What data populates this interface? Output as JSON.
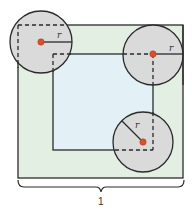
{
  "diagram": {
    "outer_square": {
      "x": 18,
      "y": 25,
      "w": 165,
      "h": 153,
      "fill": "#e2efe2",
      "stroke": "#2b2b2b"
    },
    "inner_square": {
      "x": 53,
      "y": 54,
      "w": 100,
      "h": 96,
      "fill": "#e3f1f7",
      "stroke": "#2b2b2b"
    },
    "circles": [
      {
        "id": "top-left",
        "cx": 41,
        "cy": 42,
        "r": 31,
        "radius_label": "r",
        "label_x": 58,
        "label_y": 37
      },
      {
        "id": "top-right",
        "cx": 153,
        "cy": 55,
        "r": 30,
        "radius_label": "r",
        "label_x": 171,
        "label_y": 51
      },
      {
        "id": "bottom-right",
        "cx": 143,
        "cy": 142,
        "r": 30,
        "radius_label": "r",
        "label_x": 136,
        "label_y": 127
      }
    ],
    "circle_fill": "#d9d9d9",
    "center_dot_color": "#d9512c",
    "brace": {
      "x1": 18,
      "x2": 184,
      "y": 187,
      "label": "1"
    }
  }
}
